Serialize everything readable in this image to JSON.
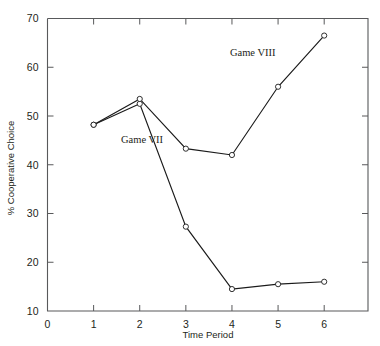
{
  "chart_data": {
    "type": "line",
    "title": "",
    "xlabel": "Time Period",
    "ylabel": "% Cooperative Choice",
    "x": [
      1,
      2,
      3,
      4,
      5,
      6
    ],
    "xticks": [
      0,
      1,
      2,
      3,
      4,
      5,
      6
    ],
    "xtick_labels": [
      "0",
      "1",
      "2",
      "3",
      "4",
      "5",
      "6"
    ],
    "yticks": [
      10,
      20,
      30,
      40,
      50,
      60,
      70
    ],
    "ytick_labels": [
      "10",
      "20",
      "30",
      "40",
      "50",
      "60",
      "70"
    ],
    "xlim": [
      0,
      6.95
    ],
    "ylim": [
      10,
      70
    ],
    "grid": false,
    "legend_position": "inline-annotations",
    "marker": "open-circle",
    "line_color": "#1a1a1a",
    "frame_color": "#58595b",
    "background_color": "#ffffff",
    "series": [
      {
        "name": "Game VII",
        "values": [
          48.2,
          52.5,
          27.3,
          14.5,
          15.5,
          16.0
        ],
        "annotation": "Game VII"
      },
      {
        "name": "Game VIII",
        "values": [
          48.2,
          53.5,
          43.3,
          42.0,
          56.0,
          66.5
        ],
        "annotation": "Game VIII"
      }
    ],
    "annotations": [
      {
        "text": "Game VII",
        "x": 2.05,
        "y": 44.4
      },
      {
        "text": "Game VIII",
        "x": 4.45,
        "y": 62.3
      }
    ]
  }
}
